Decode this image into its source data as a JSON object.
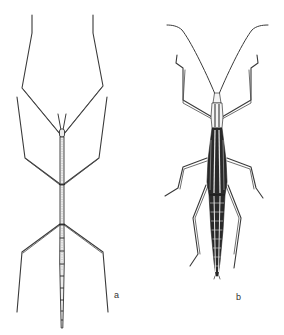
{
  "figure": {
    "specimens": [
      {
        "id": "a",
        "label": "a",
        "form": "slender, elongate stick insect with very long legs and short antennae"
      },
      {
        "id": "b",
        "label": "b",
        "form": "stouter stick insect with long curved antennae and darkly striped thorax/abdomen"
      }
    ],
    "colors": {
      "ink": "#333333",
      "background": "#ffffff",
      "shading": "#2a2a2a"
    }
  }
}
